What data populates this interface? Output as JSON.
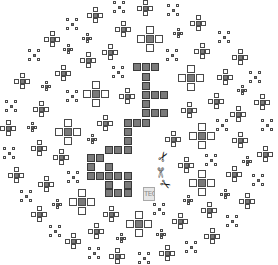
{
  "colors": {
    "background": "#ffffff",
    "outline": "#4a4a4a",
    "fill": "#7a7a7a"
  },
  "label": {
    "text": "TEC",
    "x": 143,
    "y": 187,
    "w": 12,
    "h": 14
  },
  "glyphs": [
    {
      "name": "scissors-icon",
      "char": "✂",
      "x": 158,
      "y": 150,
      "rot": -60
    },
    {
      "name": "scissors-icon",
      "char": "✄",
      "x": 155,
      "y": 166,
      "rot": 90
    },
    {
      "name": "scissors-icon",
      "char": "✂",
      "x": 160,
      "y": 178,
      "rot": 30
    }
  ],
  "blocks": [
    [
      137,
      67
    ],
    [
      146,
      67
    ],
    [
      155,
      67
    ],
    [
      146,
      77
    ],
    [
      146,
      86
    ],
    [
      146,
      95
    ],
    [
      155,
      95
    ],
    [
      164,
      95
    ],
    [
      146,
      104
    ],
    [
      146,
      113
    ],
    [
      155,
      113
    ],
    [
      164,
      113
    ],
    [
      128,
      123
    ],
    [
      137,
      123
    ],
    [
      146,
      123
    ],
    [
      128,
      132
    ],
    [
      128,
      141
    ],
    [
      109,
      150
    ],
    [
      118,
      150
    ],
    [
      128,
      150
    ],
    [
      91,
      158
    ],
    [
      100,
      158
    ],
    [
      91,
      167
    ],
    [
      109,
      167
    ],
    [
      91,
      176
    ],
    [
      100,
      176
    ],
    [
      109,
      176
    ],
    [
      118,
      176
    ],
    [
      128,
      176
    ],
    [
      109,
      185
    ],
    [
      128,
      185
    ],
    [
      109,
      193
    ],
    [
      118,
      193
    ],
    [
      128,
      193
    ]
  ],
  "crosses": [
    {
      "t": "M",
      "x": 95,
      "y": 15
    },
    {
      "t": "X",
      "x": 119,
      "y": 7
    },
    {
      "t": "X",
      "x": 72,
      "y": 24
    },
    {
      "t": "M",
      "x": 123,
      "y": 29
    },
    {
      "t": "M",
      "x": 52,
      "y": 39
    },
    {
      "t": "S",
      "x": 87,
      "y": 38
    },
    {
      "t": "X",
      "x": 34,
      "y": 55
    },
    {
      "t": "S",
      "x": 68,
      "y": 49
    },
    {
      "t": "M",
      "x": 110,
      "y": 52
    },
    {
      "t": "M",
      "x": 88,
      "y": 60
    },
    {
      "t": "M",
      "x": 63,
      "y": 73
    },
    {
      "t": "X",
      "x": 118,
      "y": 72
    },
    {
      "t": "M",
      "x": 22,
      "y": 81
    },
    {
      "t": "S",
      "x": 46,
      "y": 86
    },
    {
      "t": "L",
      "x": 96,
      "y": 94
    },
    {
      "t": "X",
      "x": 72,
      "y": 96
    },
    {
      "t": "M",
      "x": 127,
      "y": 96
    },
    {
      "t": "X",
      "x": 11,
      "y": 106
    },
    {
      "t": "M",
      "x": 41,
      "y": 109
    },
    {
      "t": "M",
      "x": 105,
      "y": 123
    },
    {
      "t": "M",
      "x": 8,
      "y": 128
    },
    {
      "t": "S",
      "x": 32,
      "y": 127
    },
    {
      "t": "L",
      "x": 68,
      "y": 132
    },
    {
      "t": "M",
      "x": 145,
      "y": 8
    },
    {
      "t": "X",
      "x": 173,
      "y": 10
    },
    {
      "t": "M",
      "x": 198,
      "y": 23
    },
    {
      "t": "S",
      "x": 178,
      "y": 33
    },
    {
      "t": "X",
      "x": 224,
      "y": 37
    },
    {
      "t": "L",
      "x": 150,
      "y": 39
    },
    {
      "t": "X",
      "x": 172,
      "y": 55
    },
    {
      "t": "M",
      "x": 202,
      "y": 51
    },
    {
      "t": "M",
      "x": 240,
      "y": 57
    },
    {
      "t": "L",
      "x": 191,
      "y": 78
    },
    {
      "t": "M",
      "x": 225,
      "y": 77
    },
    {
      "t": "X",
      "x": 255,
      "y": 77
    },
    {
      "t": "S",
      "x": 242,
      "y": 90
    },
    {
      "t": "M",
      "x": 216,
      "y": 101
    },
    {
      "t": "M",
      "x": 262,
      "y": 102
    },
    {
      "t": "M",
      "x": 189,
      "y": 110
    },
    {
      "t": "M",
      "x": 238,
      "y": 114
    },
    {
      "t": "X",
      "x": 222,
      "y": 125
    },
    {
      "t": "X",
      "x": 267,
      "y": 125
    },
    {
      "t": "L",
      "x": 202,
      "y": 136
    },
    {
      "t": "S",
      "x": 92,
      "y": 139
    },
    {
      "t": "M",
      "x": 39,
      "y": 148
    },
    {
      "t": "X",
      "x": 9,
      "y": 153
    },
    {
      "t": "M",
      "x": 61,
      "y": 157
    },
    {
      "t": "M",
      "x": 16,
      "y": 175
    },
    {
      "t": "X",
      "x": 73,
      "y": 177
    },
    {
      "t": "M",
      "x": 46,
      "y": 184
    },
    {
      "t": "X",
      "x": 26,
      "y": 196
    },
    {
      "t": "S",
      "x": 57,
      "y": 204
    },
    {
      "t": "L",
      "x": 82,
      "y": 202
    },
    {
      "t": "M",
      "x": 111,
      "y": 214
    },
    {
      "t": "M",
      "x": 39,
      "y": 214
    },
    {
      "t": "X",
      "x": 55,
      "y": 231
    },
    {
      "t": "M",
      "x": 96,
      "y": 231
    },
    {
      "t": "M",
      "x": 73,
      "y": 241
    },
    {
      "t": "S",
      "x": 121,
      "y": 238
    },
    {
      "t": "X",
      "x": 94,
      "y": 253
    },
    {
      "t": "M",
      "x": 117,
      "y": 256
    },
    {
      "t": "M",
      "x": 173,
      "y": 139
    },
    {
      "t": "M",
      "x": 240,
      "y": 140
    },
    {
      "t": "M",
      "x": 265,
      "y": 154
    },
    {
      "t": "X",
      "x": 211,
      "y": 160
    },
    {
      "t": "S",
      "x": 247,
      "y": 161
    },
    {
      "t": "M",
      "x": 186,
      "y": 165
    },
    {
      "t": "M",
      "x": 234,
      "y": 174
    },
    {
      "t": "L",
      "x": 202,
      "y": 183
    },
    {
      "t": "X",
      "x": 258,
      "y": 180
    },
    {
      "t": "S",
      "x": 225,
      "y": 194
    },
    {
      "t": "S",
      "x": 188,
      "y": 200
    },
    {
      "t": "M",
      "x": 247,
      "y": 201
    },
    {
      "t": "X",
      "x": 159,
      "y": 209
    },
    {
      "t": "M",
      "x": 209,
      "y": 210
    },
    {
      "t": "M",
      "x": 180,
      "y": 221
    },
    {
      "t": "X",
      "x": 232,
      "y": 221
    },
    {
      "t": "S",
      "x": 161,
      "y": 234
    },
    {
      "t": "M",
      "x": 212,
      "y": 236
    },
    {
      "t": "X",
      "x": 191,
      "y": 247
    },
    {
      "t": "M",
      "x": 167,
      "y": 253
    },
    {
      "t": "X",
      "x": 144,
      "y": 258
    },
    {
      "t": "L",
      "x": 139,
      "y": 224
    }
  ]
}
